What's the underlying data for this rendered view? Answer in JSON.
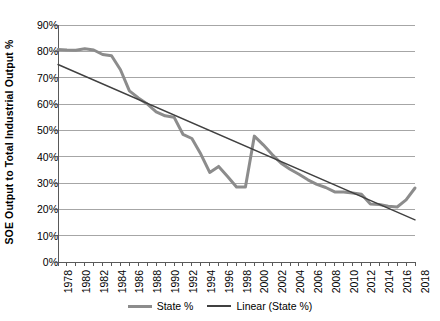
{
  "chart_data": {
    "type": "line",
    "title": "",
    "xlabel": "",
    "ylabel": "SOE Output to Total Industrial Output %",
    "xlim": [
      1978,
      2018
    ],
    "ylim": [
      0,
      90
    ],
    "ytick_labels": [
      "0%",
      "10%",
      "20%",
      "30%",
      "40%",
      "50%",
      "60%",
      "70%",
      "80%",
      "90%"
    ],
    "ytick_values": [
      0,
      10,
      20,
      30,
      40,
      50,
      60,
      70,
      80,
      90
    ],
    "xtick_labels": [
      "1978",
      "1980",
      "1982",
      "1984",
      "1986",
      "1988",
      "1990",
      "1992",
      "1994",
      "1996",
      "1998",
      "2000",
      "2002",
      "2004",
      "2006",
      "2008",
      "2010",
      "2012",
      "2014",
      "2016",
      "2018"
    ],
    "xtick_values": [
      1978,
      1980,
      1982,
      1984,
      1986,
      1988,
      1990,
      1992,
      1994,
      1996,
      1998,
      2000,
      2002,
      2004,
      2006,
      2008,
      2010,
      2012,
      2014,
      2016,
      2018
    ],
    "grid": "horizontal",
    "legend_position": "bottom",
    "series": [
      {
        "name": "State %",
        "kind": "data",
        "color": "#8c8c8c",
        "width": 3,
        "x": [
          1978,
          1979,
          1980,
          1981,
          1982,
          1983,
          1984,
          1985,
          1986,
          1987,
          1988,
          1989,
          1990,
          1991,
          1992,
          1993,
          1994,
          1995,
          1996,
          1997,
          1998,
          1999,
          2000,
          2001,
          2002,
          2003,
          2004,
          2005,
          2006,
          2007,
          2008,
          2009,
          2010,
          2011,
          2012,
          2013,
          2014,
          2015,
          2016,
          2017,
          2018
        ],
        "values": [
          80.7,
          80.5,
          80.4,
          81.0,
          80.5,
          78.8,
          78.3,
          73.0,
          65.0,
          62.3,
          60.0,
          57.0,
          55.5,
          55.0,
          48.5,
          46.9,
          41.0,
          34.0,
          36.3,
          32.5,
          28.5,
          28.5,
          47.8,
          44.5,
          40.8,
          37.5,
          35.2,
          33.3,
          31.2,
          29.5,
          28.3,
          26.6,
          26.6,
          26.2,
          25.7,
          22.0,
          21.8,
          21.2,
          20.9,
          23.6,
          28.1
        ]
      },
      {
        "name": "Linear (State %)",
        "kind": "trendline",
        "color": "#404040",
        "width": 1.4,
        "x": [
          1978,
          2018
        ],
        "values": [
          75.0,
          16.0
        ]
      }
    ]
  },
  "legend": {
    "items": [
      {
        "label": "State %",
        "swatch": "thick-gray-line"
      },
      {
        "label": "Linear (State %)",
        "swatch": "thin-dark-line"
      }
    ]
  },
  "colors": {
    "series": "#8c8c8c",
    "trendline": "#404040",
    "grid": "#a6a6a6",
    "axis": "#595959",
    "text": "#000000",
    "background": "#ffffff"
  }
}
